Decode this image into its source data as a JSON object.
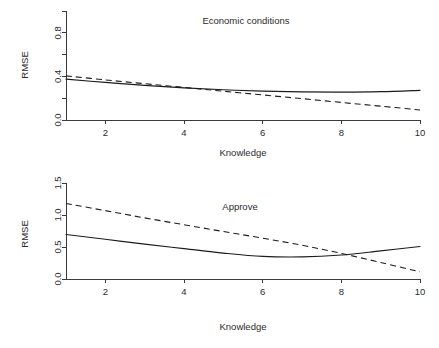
{
  "figure": {
    "width": 439,
    "height": 348,
    "background": "#ffffff",
    "ink_color": "#1c1c1c",
    "axis_color": "#3a3a3a"
  },
  "chart_data": [
    {
      "type": "line",
      "title": "Economic conditions",
      "xlabel": "Knowledge",
      "ylabel": "RMSE",
      "xlim": [
        1,
        10
      ],
      "ylim": [
        0.0,
        1.0
      ],
      "xticks": [
        2,
        4,
        6,
        8,
        10
      ],
      "xticklabels": [
        "2",
        "4",
        "6",
        "8",
        "10"
      ],
      "yticks": [
        0.0,
        0.2,
        0.4,
        0.6,
        0.8,
        1.0
      ],
      "yticklabels": [
        "0.0",
        "",
        "0.4",
        "",
        "0.8",
        ""
      ],
      "grid": false,
      "legend": "none",
      "x": [
        1,
        2,
        3,
        4,
        5,
        6,
        7,
        8,
        9,
        10
      ],
      "series": [
        {
          "name": "solid",
          "style": "solid",
          "values": [
            0.375,
            0.345,
            0.318,
            0.295,
            0.277,
            0.265,
            0.258,
            0.256,
            0.26,
            0.272
          ]
        },
        {
          "name": "dashed",
          "style": "dashed",
          "values": [
            0.405,
            0.368,
            0.333,
            0.299,
            0.264,
            0.23,
            0.196,
            0.161,
            0.127,
            0.092
          ]
        }
      ]
    },
    {
      "type": "line",
      "title": "Approve",
      "xlabel": "Knowledge",
      "ylabel": "RMSE",
      "xlim": [
        1,
        10
      ],
      "ylim": [
        0.0,
        1.5
      ],
      "xticks": [
        2,
        4,
        6,
        8,
        10
      ],
      "xticklabels": [
        "2",
        "4",
        "6",
        "8",
        "10"
      ],
      "yticks": [
        0.0,
        0.5,
        1.0,
        1.5
      ],
      "yticklabels": [
        "0.0",
        "0.5",
        "1.0",
        "1.5"
      ],
      "grid": false,
      "legend": "none",
      "x": [
        1,
        2,
        3,
        4,
        5,
        6,
        7,
        8,
        9,
        10
      ],
      "series": [
        {
          "name": "solid",
          "style": "solid",
          "values": [
            0.695,
            0.62,
            0.545,
            0.475,
            0.405,
            0.353,
            0.345,
            0.375,
            0.44,
            0.508
          ]
        },
        {
          "name": "dashed",
          "style": "dashed",
          "values": [
            1.18,
            1.068,
            0.955,
            0.848,
            0.742,
            0.638,
            0.528,
            0.4,
            0.258,
            0.112
          ]
        }
      ]
    }
  ]
}
